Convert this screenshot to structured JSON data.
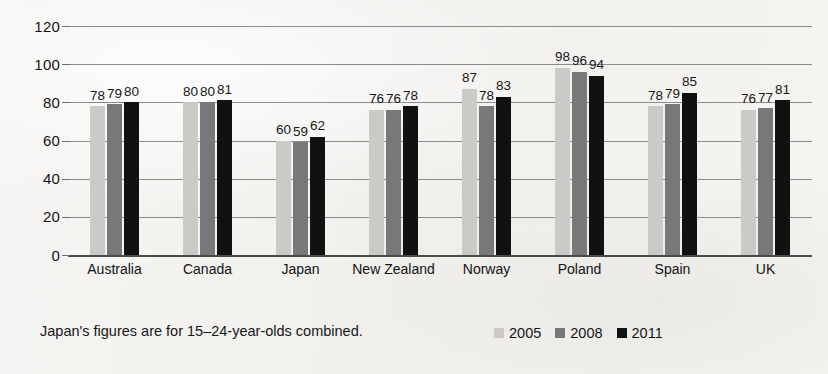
{
  "chart_data": {
    "type": "bar",
    "title": "",
    "xlabel": "",
    "ylabel": "",
    "ylim": [
      0,
      120
    ],
    "yticks": [
      0,
      20,
      40,
      60,
      80,
      100,
      120
    ],
    "grid": true,
    "legend_position": "bottom-right",
    "categories": [
      "Australia",
      "Canada",
      "Japan",
      "New Zealand",
      "Norway",
      "Poland",
      "Spain",
      "UK"
    ],
    "series": [
      {
        "name": "2005",
        "color": "#cccac7",
        "values": [
          78,
          80,
          60,
          76,
          87,
          98,
          78,
          76
        ]
      },
      {
        "name": "2008",
        "color": "#78787a",
        "values": [
          79,
          80,
          59,
          76,
          78,
          96,
          79,
          77
        ]
      },
      {
        "name": "2011",
        "color": "#111111",
        "values": [
          80,
          81,
          62,
          78,
          83,
          94,
          85,
          81
        ]
      }
    ],
    "annotations": [
      "Japan's figures are for 15–24-year-olds combined."
    ]
  },
  "footnote": "Japan's figures are for 15–24-year-olds combined.",
  "legend": [
    {
      "label": "2005",
      "color": "#cccac7"
    },
    {
      "label": "2008",
      "color": "#78787a"
    },
    {
      "label": "2011",
      "color": "#111111"
    }
  ]
}
